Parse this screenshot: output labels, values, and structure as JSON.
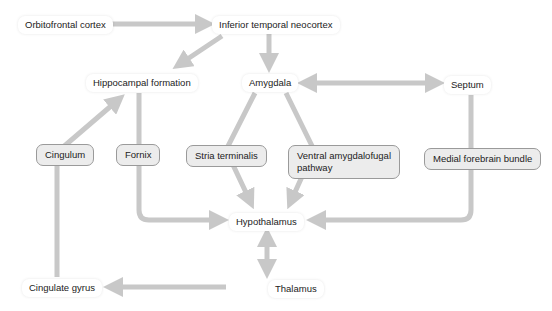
{
  "diagram": {
    "colors": {
      "arrow": "#c8c8c8",
      "node_fill": "#ffffff",
      "tract_fill": "#ececec",
      "tract_border": "#9a9a9a",
      "text": "#222222"
    },
    "nodes": {
      "orbitofrontal": "Orbitofrontal cortex",
      "inferior_temporal": "Inferior temporal neocortex",
      "hippocampal": "Hippocampal formation",
      "amygdala": "Amygdala",
      "septum": "Septum",
      "hypothalamus": "Hypothalamus",
      "thalamus": "Thalamus",
      "cingulate_gyrus": "Cingulate gyrus"
    },
    "tracts": {
      "cingulum": "Cingulum",
      "fornix": "Fornix",
      "stria_terminalis": "Stria terminalis",
      "ventral_amygdalofugal": "Ventral amygdalofugal pathway",
      "medial_forebrain_bundle": "Medial forebrain bundle"
    },
    "edges": [
      {
        "from": "Orbitofrontal cortex",
        "to": "Inferior temporal neocortex",
        "type": "one-way"
      },
      {
        "from": "Inferior temporal neocortex",
        "to": "Hippocampal formation",
        "type": "one-way"
      },
      {
        "from": "Inferior temporal neocortex",
        "to": "Amygdala",
        "type": "one-way"
      },
      {
        "from": "Amygdala",
        "to": "Septum",
        "type": "two-way"
      },
      {
        "from": "Hippocampal formation",
        "to": "Hypothalamus",
        "via": "Fornix",
        "type": "one-way"
      },
      {
        "from": "Amygdala",
        "to": "Hypothalamus",
        "via": "Stria terminalis",
        "type": "one-way"
      },
      {
        "from": "Amygdala",
        "to": "Hypothalamus",
        "via": "Ventral amygdalofugal pathway",
        "type": "one-way"
      },
      {
        "from": "Septum",
        "to": "Hypothalamus",
        "via": "Medial forebrain bundle",
        "type": "one-way"
      },
      {
        "from": "Hypothalamus",
        "to": "Thalamus",
        "type": "two-way"
      },
      {
        "from": "Thalamus",
        "to": "Cingulate gyrus",
        "type": "one-way"
      },
      {
        "from": "Cingulate gyrus",
        "to": "Hippocampal formation",
        "via": "Cingulum",
        "type": "one-way"
      }
    ]
  }
}
